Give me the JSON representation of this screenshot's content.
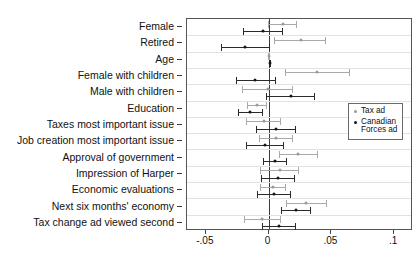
{
  "chart_data": {
    "type": "scatter",
    "title": "",
    "xlabel": "",
    "ylabel": "",
    "xlim": [
      -0.065,
      0.115
    ],
    "grid": true,
    "legend_position": "middle-right",
    "xticks": [
      -0.05,
      0,
      0.05,
      0.1
    ],
    "xticklabels": [
      "-.05",
      "0",
      ".05",
      ".1"
    ],
    "categories": [
      "Female",
      "Retired",
      "Age",
      "Female with children",
      "Male with children",
      "Education",
      "Taxes most important issue",
      "Job creation most important issue",
      "Approval of government",
      "Impression of Harper",
      "Economic evaluations",
      "Next six months' economy",
      "Tax change ad viewed second"
    ],
    "series": [
      {
        "name": "Tax ad",
        "color": "#9a9a9a",
        "estimates": [
          0.0115,
          0.0255,
          0.0005,
          0.0385,
          -0.0005,
          -0.0095,
          -0.004,
          0.006,
          0.0005,
          0.0235,
          0.009,
          0.0035,
          0.03,
          -0.005
        ],
        "values": [
          0.0115,
          0.0255,
          0.0005,
          0.0385,
          -0.0005,
          -0.0095,
          -0.004,
          0.006,
          0.0235,
          0.009,
          0.0035,
          0.03,
          -0.005
        ],
        "ci_low": [
          -0.0005,
          0.0045,
          -0.0005,
          0.013,
          -0.021,
          -0.0175,
          -0.018,
          -0.0075,
          0.008,
          -0.0065,
          -0.007,
          0.014,
          -0.02
        ],
        "ci_high": [
          0.0225,
          0.046,
          0.0015,
          0.0645,
          0.0195,
          -0.0015,
          0.01,
          0.0195,
          0.039,
          0.0245,
          0.014,
          0.0465,
          0.0095
        ]
      },
      {
        "name": "Canadian Forces ad",
        "color": "#151515",
        "values": [
          -0.0045,
          -0.0185,
          0.001,
          -0.0105,
          0.0175,
          -0.0145,
          0.006,
          -0.003,
          0.005,
          0.0075,
          0.004,
          0.0215,
          0.0085
        ],
        "ci_low": [
          -0.0205,
          -0.038,
          0.0,
          -0.026,
          -0.002,
          -0.0245,
          -0.01,
          -0.018,
          -0.0045,
          -0.006,
          -0.0095,
          0.0095,
          -0.005
        ],
        "ci_high": [
          0.0115,
          0.001,
          0.002,
          0.0055,
          0.037,
          -0.0045,
          0.022,
          0.012,
          0.0145,
          0.021,
          0.0175,
          0.034,
          0.022
        ]
      }
    ]
  },
  "legend": {
    "items": [
      {
        "label": "Tax ad",
        "series": "Tax ad"
      },
      {
        "label": "Canadian\nForces ad",
        "series": "Canadian Forces ad"
      }
    ]
  },
  "colors": {
    "tax_ad": "#9a9a9a",
    "cf_ad": "#151515",
    "zero_line": "#3b3b3b",
    "grid": "#e2e2e2",
    "frame": "#555555",
    "background": "#ffffff"
  }
}
